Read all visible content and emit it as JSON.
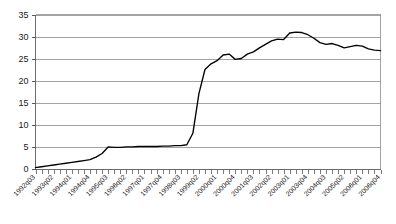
{
  "chart_data": {
    "type": "line",
    "title": "",
    "subtitle": "",
    "xlabel": "",
    "ylabel": "",
    "ylim": [
      0,
      35
    ],
    "yticks": [
      0,
      5,
      10,
      15,
      20,
      25,
      30,
      35
    ],
    "grid": true,
    "legend": false,
    "legend_position": "none",
    "line_color": "#000000",
    "gridline_color": "#8c8c8c",
    "axis_color": "#6b6b6b",
    "xtick_label_rotation": -45,
    "xtick_label_interval": 3,
    "xtick_labels": [
      "1992q03",
      "1993q02",
      "1994q01",
      "1994q04",
      "1995q03",
      "1996q02",
      "1997q01",
      "1997q04",
      "1998q03",
      "1999q02",
      "2000q01",
      "2000q04",
      "2001q03",
      "2002q02",
      "2003q01",
      "2003q04",
      "2004q03",
      "2005q02",
      "2006q01",
      "2006q04"
    ],
    "x": [
      "1992q03",
      "1992q04",
      "1993q01",
      "1993q02",
      "1993q03",
      "1993q04",
      "1994q01",
      "1994q02",
      "1994q03",
      "1994q04",
      "1995q01",
      "1995q02",
      "1995q03",
      "1995q04",
      "1996q01",
      "1996q02",
      "1996q03",
      "1996q04",
      "1997q01",
      "1997q02",
      "1997q03",
      "1997q04",
      "1998q01",
      "1998q02",
      "1998q03",
      "1998q04",
      "1999q01",
      "1999q02",
      "1999q03",
      "1999q04",
      "2000q01",
      "2000q02",
      "2000q03",
      "2000q04",
      "2001q01",
      "2001q02",
      "2001q03",
      "2001q04",
      "2002q01",
      "2002q02",
      "2002q03",
      "2002q04",
      "2003q01",
      "2003q02",
      "2003q03",
      "2003q04",
      "2004q01",
      "2004q02",
      "2004q03",
      "2004q04",
      "2005q01",
      "2005q02",
      "2005q03",
      "2005q04",
      "2006q01",
      "2006q02",
      "2006q03",
      "2006q04"
    ],
    "series": [
      {
        "name": "series-1",
        "values": [
          0.2,
          0.4,
          0.6,
          0.8,
          1.0,
          1.2,
          1.4,
          1.6,
          1.8,
          2.0,
          2.6,
          3.4,
          4.9,
          4.8,
          4.8,
          4.9,
          4.9,
          5.0,
          5.0,
          5.0,
          5.0,
          5.1,
          5.1,
          5.2,
          5.2,
          5.4,
          8.0,
          17.0,
          22.5,
          23.8,
          24.5,
          25.8,
          26.0,
          24.8,
          25.0,
          26.0,
          26.5,
          27.4,
          28.2,
          29.0,
          29.4,
          29.3,
          30.8,
          31.0,
          30.9,
          30.4,
          29.6,
          28.6,
          28.2,
          28.4,
          28.0,
          27.4,
          27.7,
          28.0,
          27.8,
          27.2,
          26.9,
          26.8
        ]
      }
    ]
  }
}
